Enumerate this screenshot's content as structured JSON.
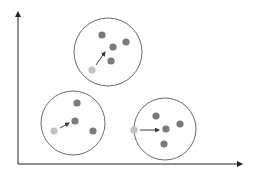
{
  "diagram": {
    "title": "",
    "colors": {
      "axis": "#222222",
      "circle_stroke": "#6b6b6b",
      "dot_dark": "#7a7a7a",
      "dot_light": "#c2c2c2",
      "arrow": "#3a3a3a",
      "background": "#ffffff"
    },
    "axes": {
      "origin": [
        18,
        164
      ],
      "x_end": [
        242,
        164
      ],
      "y_end": [
        18,
        12
      ],
      "x_label": "",
      "y_label": ""
    },
    "clusters": [
      {
        "name": "top",
        "circle": {
          "cx": 108,
          "cy": 52,
          "r": 34
        },
        "centroid_start": {
          "cx": 92,
          "cy": 70
        },
        "points": [
          {
            "cx": 102,
            "cy": 35
          },
          {
            "cx": 113,
            "cy": 47
          },
          {
            "cx": 126,
            "cy": 42
          },
          {
            "cx": 111,
            "cy": 61
          }
        ],
        "arrow": {
          "x1": 96,
          "y1": 65,
          "x2": 105,
          "y2": 52
        }
      },
      {
        "name": "bottom-left",
        "circle": {
          "cx": 73,
          "cy": 123,
          "r": 32
        },
        "centroid_start": {
          "cx": 54,
          "cy": 131
        },
        "points": [
          {
            "cx": 77,
            "cy": 103
          },
          {
            "cx": 75,
            "cy": 121
          },
          {
            "cx": 93,
            "cy": 131
          }
        ],
        "arrow": {
          "x1": 60,
          "y1": 128,
          "x2": 69,
          "y2": 123
        }
      },
      {
        "name": "bottom-right",
        "circle": {
          "cx": 165,
          "cy": 129,
          "r": 31
        },
        "centroid_start": {
          "cx": 134,
          "cy": 130
        },
        "points": [
          {
            "cx": 156,
            "cy": 116
          },
          {
            "cx": 166,
            "cy": 129
          },
          {
            "cx": 180,
            "cy": 124
          },
          {
            "cx": 164,
            "cy": 144
          }
        ],
        "arrow": {
          "x1": 140,
          "y1": 130,
          "x2": 159,
          "y2": 130
        }
      }
    ]
  }
}
